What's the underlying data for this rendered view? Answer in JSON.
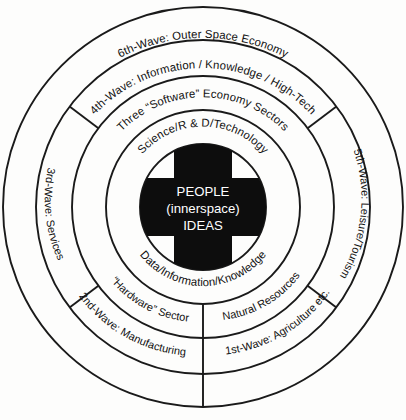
{
  "diagram": {
    "center": {
      "line1": "PEOPLE",
      "line2": "(innerspace)",
      "line3": "IDEAS"
    },
    "rings": [
      {
        "index": 1,
        "name": "innermost-sector-ring",
        "top_label": "Science/R & D/Technology",
        "bottom_label": "Data/Information/Knowledge"
      },
      {
        "index": 2,
        "name": "software-hardware-ring",
        "top_label": "Three “Software” Economy Sectors",
        "bottom_left_label": "“Hardware” Sector",
        "bottom_right_label": "Natural Resources"
      },
      {
        "index": 3,
        "name": "wave-ring-inner",
        "top_label": "4th-Wave: Information / Knowledge / High-Tech",
        "left_label": "3rd-Wave: Services",
        "right_label": "5th-Wave: Leisure/Tourism",
        "bottom_left_label": "2nd-Wave: Manufacturing",
        "bottom_right_label": "1st-Wave: Agriculture etc."
      },
      {
        "index": 4,
        "name": "outer-wave-ring",
        "top_label": "6th-Wave: Outer Space Economy"
      }
    ],
    "colors": {
      "stroke": "#1a1a1a",
      "cross_fill": "#0d0d0d",
      "center_text": "#ffffff",
      "background": "#fdfdfc",
      "label_text": "#111111"
    }
  }
}
